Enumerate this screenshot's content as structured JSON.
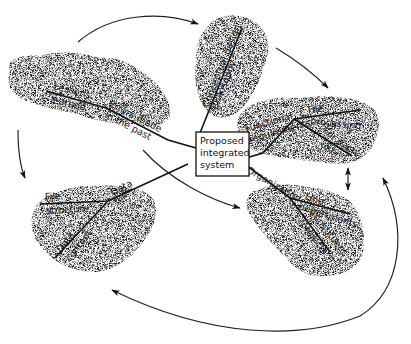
{
  "diagram": {
    "center": {
      "lines": [
        "Proposed",
        "integrated",
        "system"
      ]
    },
    "clouds": [
      {
        "id": "lessons",
        "labels": {
          "a": "Lessons",
          "b": "learned",
          "c": "Errors made",
          "d": "in the past"
        }
      },
      {
        "id": "conceptual",
        "labels": {
          "a": "Conceptual design",
          "b": "philosophy"
        }
      },
      {
        "id": "functional",
        "labels": {
          "a": "Functional",
          "b": "requirements",
          "c": "File",
          "d": "processing",
          "e": "For each",
          "f": "user"
        }
      },
      {
        "id": "organization",
        "labels": {
          "a": "Organization",
          "b": "Line",
          "c": "departments",
          "d": "Constituent",
          "e": "projects"
        }
      },
      {
        "id": "data",
        "labels": {
          "a": "File",
          "b": "structure",
          "c": "Data",
          "d": "files",
          "e": "Data",
          "f": "content"
        }
      }
    ],
    "arrows": [
      {
        "from": "lessons",
        "to": "conceptual"
      },
      {
        "from": "conceptual",
        "to": "functional"
      },
      {
        "from": "functional",
        "to": "organization",
        "bidirectional": true
      },
      {
        "from": "organization",
        "to": "data"
      },
      {
        "from": "data",
        "to": "functional"
      },
      {
        "from": "lessons",
        "to": "data"
      },
      {
        "from": "lessons",
        "to": "organization"
      }
    ],
    "colors": {
      "stipple": "#8a8a8a",
      "line": "#111111",
      "background": "#ffffff"
    }
  }
}
